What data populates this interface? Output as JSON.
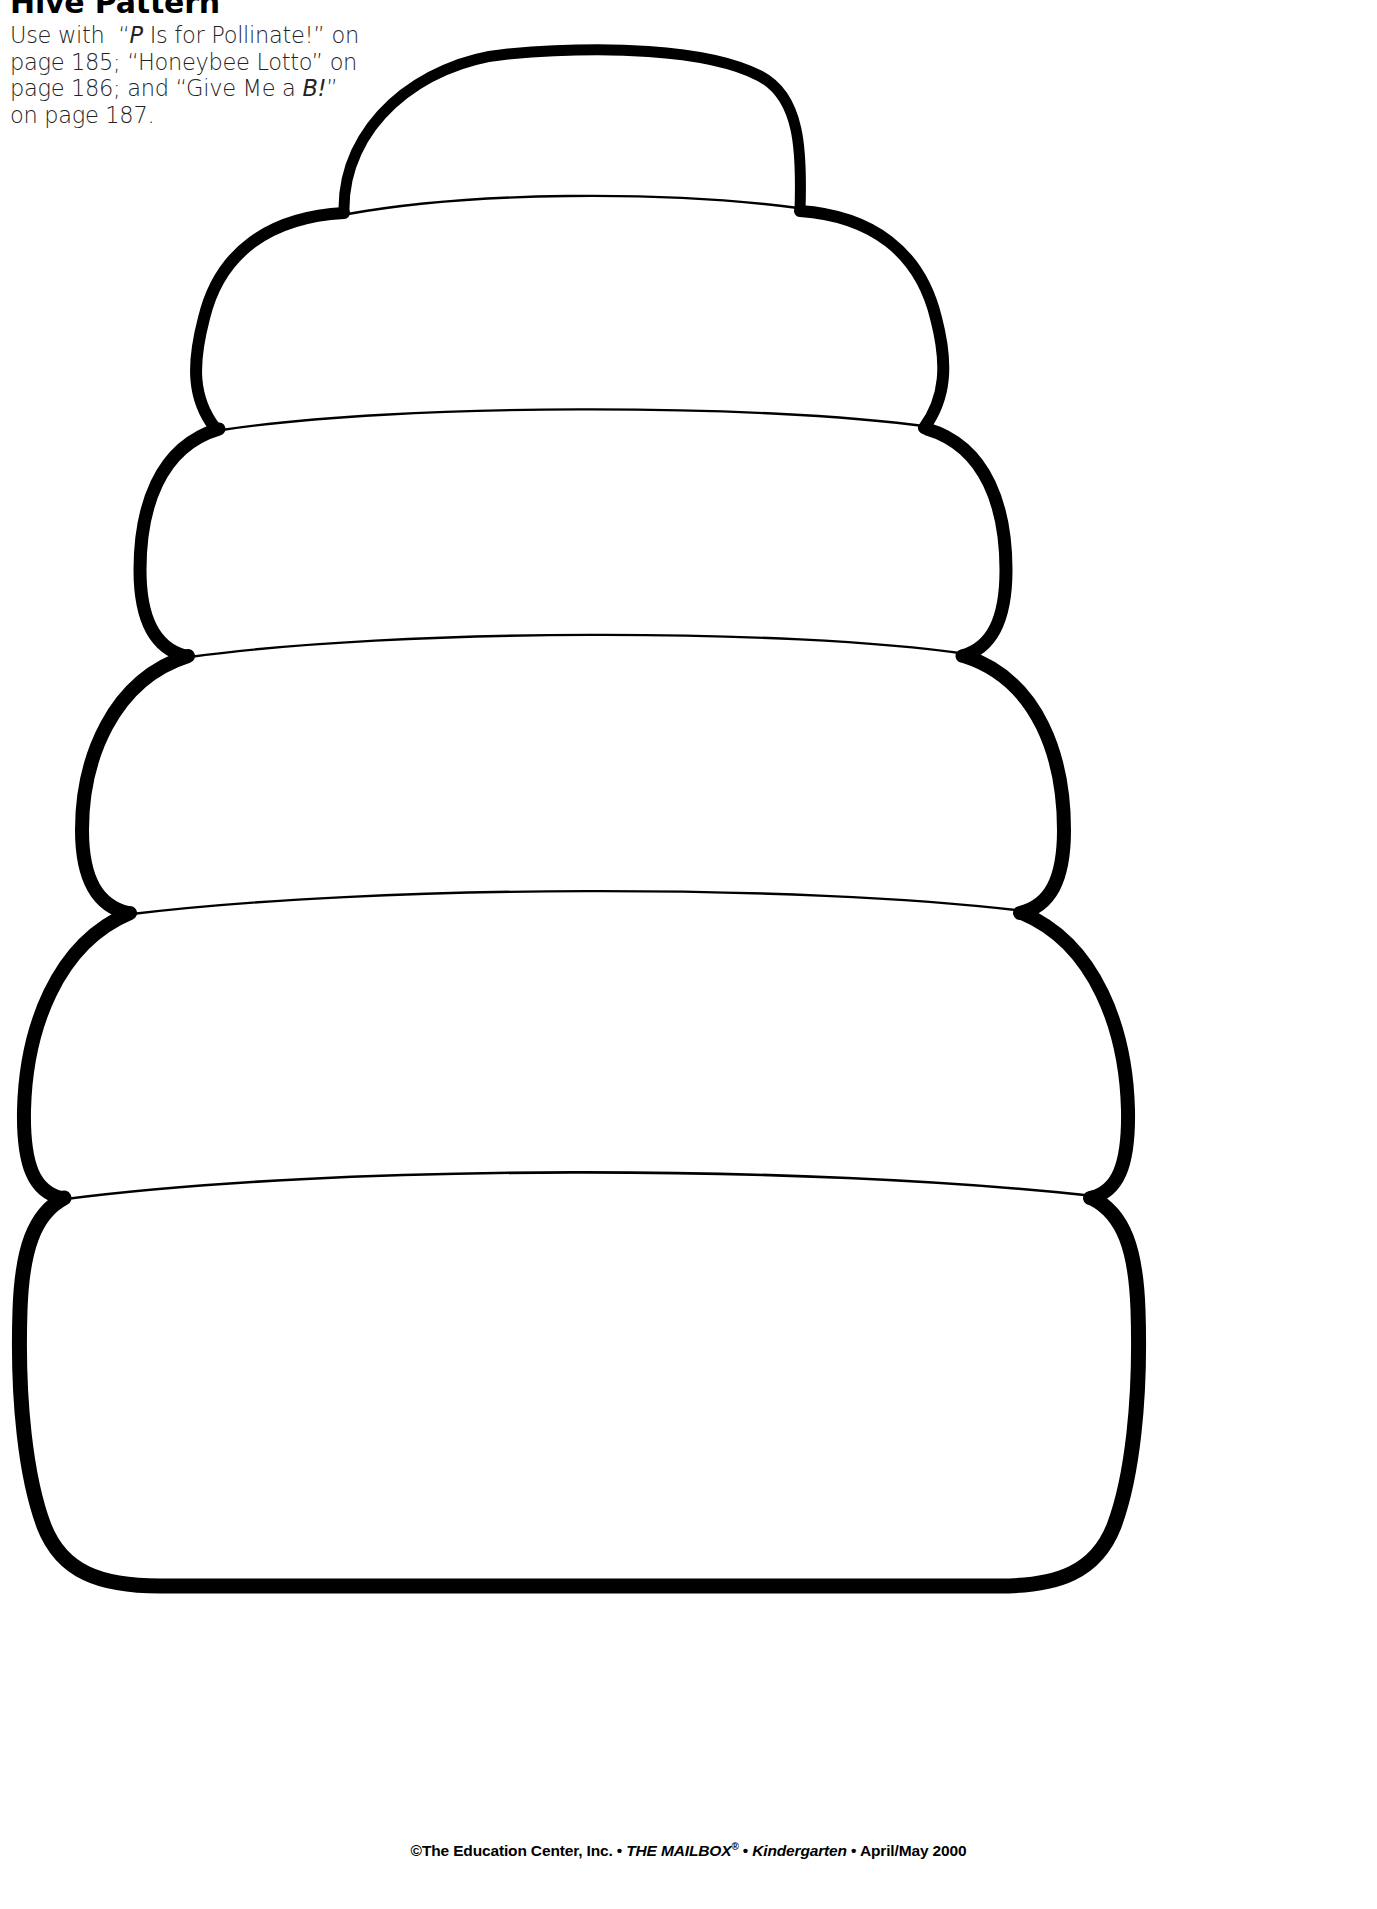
{
  "document": {
    "title": "Hive Pattern",
    "type": "worksheet-pattern-template",
    "background_color": "#ffffff",
    "ink_color": "#000000"
  },
  "header": {
    "title": "Hive Pattern",
    "instructions_lines": [
      "Use with  “P Is for Pollinate!” on",
      "page 185; “Honeybee Lotto” on",
      "page 186; and “Give Me a B!”",
      "on page 187."
    ],
    "instructions_plain": "Use with “P Is for Pollinate!” on page 185; “Honeybee Lotto” on page 186; and “Give Me a B!” on page 187.",
    "referenced_activities": [
      {
        "name": "P Is for Pollinate!",
        "page": "185"
      },
      {
        "name": "Honeybee Lotto",
        "page": "186"
      },
      {
        "name": "Give Me a B!",
        "page": "187"
      }
    ]
  },
  "artwork": {
    "name": "beehive-outline",
    "description": "Stacked beehive made of six rounded horizontal bands, widening toward the bottom",
    "band_count": 6,
    "outer_stroke_color": "#000000",
    "outer_stroke_width": 11,
    "inner_stroke_color": "#000000",
    "inner_stroke_width": 2,
    "fill_color": "#ffffff"
  },
  "footer": {
    "copyright": "©The Education Center, Inc.",
    "separator": "•",
    "publication": "THE MAILBOX",
    "registered_mark": "®",
    "grade": "Kindergarten",
    "issue": "April/May 2000",
    "full_text": "©The Education Center, Inc. • THE MAILBOX® • Kindergarten • April/May 2000"
  }
}
